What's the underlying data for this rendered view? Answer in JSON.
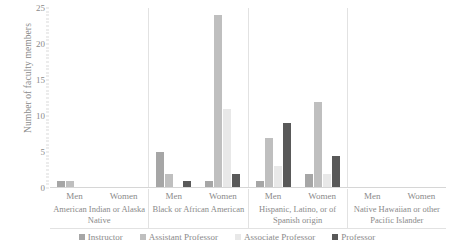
{
  "chart_data": {
    "type": "bar",
    "title": "",
    "xlabel": "",
    "ylabel": "Number of faculty members",
    "ylim": [
      0,
      25
    ],
    "yticks": [
      0,
      5,
      10,
      15,
      20,
      25
    ],
    "grid": false,
    "legend_position": "bottom",
    "categories": [
      "American Indian or Alaska Native - Men",
      "American Indian or Alaska Native - Women",
      "Black or African American - Men",
      "Black or African American - Women",
      "Hispanic, Latino, or of Spanish origin - Men",
      "Hispanic, Latino, or of Spanish origin - Women",
      "Native Hawaiian or other Pacific Islander - Men",
      "Native Hawaiian or other Pacific Islander - Women"
    ],
    "series": [
      {
        "name": "Instructor",
        "color": "#a6a6a6",
        "values": [
          1,
          0,
          5,
          1,
          1,
          2,
          0,
          0
        ]
      },
      {
        "name": "Assistant Professor",
        "color": "#bfbfbf",
        "values": [
          1,
          0,
          2,
          24,
          7,
          12,
          0,
          0
        ]
      },
      {
        "name": "Associate Professor",
        "color": "#e8e8e8",
        "values": [
          0,
          0,
          0,
          11,
          3,
          2,
          0,
          0
        ]
      },
      {
        "name": "Professor",
        "color": "#595959",
        "values": [
          0,
          0,
          1,
          2,
          9,
          4.5,
          0,
          0
        ]
      }
    ],
    "race_groups": [
      {
        "name": "American Indian or Alaska Native",
        "genders": [
          "Men",
          "Women"
        ]
      },
      {
        "name": "Black or African American",
        "genders": [
          "Men",
          "Women"
        ]
      },
      {
        "name": "Hispanic, Latino, or of Spanish origin",
        "genders": [
          "Men",
          "Women"
        ]
      },
      {
        "name": "Native Hawaiian or other Pacific Islander",
        "genders": [
          "Men",
          "Women"
        ]
      }
    ]
  },
  "axis": {
    "y_title": "Number of faculty members",
    "y_tick_labels": [
      "25",
      "20",
      "15",
      "10",
      "5",
      "0"
    ]
  },
  "legend": {
    "items": [
      {
        "label": "Instructor",
        "color": "#a6a6a6"
      },
      {
        "label": "Assistant Professor",
        "color": "#bfbfbf"
      },
      {
        "label": "Associate Professor",
        "color": "#e8e8e8"
      },
      {
        "label": "Professor",
        "color": "#595959"
      }
    ]
  }
}
